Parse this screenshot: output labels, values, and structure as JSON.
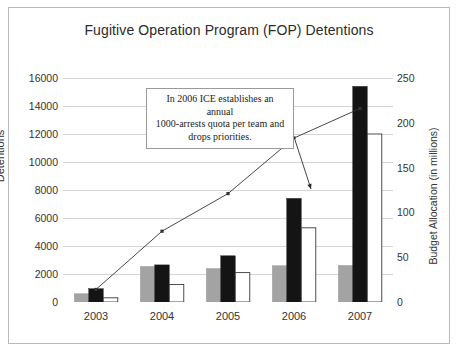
{
  "chart_data": {
    "type": "bar",
    "title": "Fugitive Operation Program (FOP) Detentions",
    "xlabel": "",
    "ylabel": "Detentions",
    "y2label": "Budget Allocation (in millions)",
    "categories": [
      "2003",
      "2004",
      "2005",
      "2006",
      "2007"
    ],
    "ylim": [
      0,
      16000
    ],
    "yticks": [
      "16000",
      "14000",
      "12000",
      "10000",
      "8000",
      "6000",
      "4000",
      "2000",
      "0"
    ],
    "ytick_values": [
      16000,
      14000,
      12000,
      10000,
      8000,
      6000,
      4000,
      2000,
      0
    ],
    "y2lim": [
      0,
      250
    ],
    "y2ticks": [
      "250",
      "200",
      "150",
      "100",
      "50",
      "0"
    ],
    "y2tick_values": [
      250,
      200,
      150,
      100,
      50,
      0
    ],
    "grid": true,
    "legend": "none",
    "series": [
      {
        "name": "gray-bars",
        "axis": "left",
        "color": "#a3a3a3",
        "values": [
          600,
          2550,
          2400,
          2600,
          2620
        ]
      },
      {
        "name": "black-bars",
        "axis": "left",
        "color": "#141414",
        "values": [
          950,
          2650,
          3300,
          7400,
          15400
        ]
      },
      {
        "name": "white-bars",
        "axis": "left",
        "color": "#ffffff",
        "values": [
          300,
          1250,
          2100,
          5300,
          12000
        ]
      },
      {
        "name": "budget-line",
        "axis": "right",
        "color": "#333333",
        "values": [
          14,
          79,
          121,
          183,
          216
        ]
      }
    ],
    "annotations": [
      {
        "name": "quota-note",
        "text": "In 2006 ICE establishes an annual 1000-arrests quota per team and drops priorities.",
        "lines": [
          "In 2006 ICE establishes an annual",
          "1000-arrests quota per team and",
          "drops priorities."
        ],
        "arrow_from": [
          295,
          140
        ],
        "arrow_to": [
          311,
          189
        ]
      }
    ]
  }
}
